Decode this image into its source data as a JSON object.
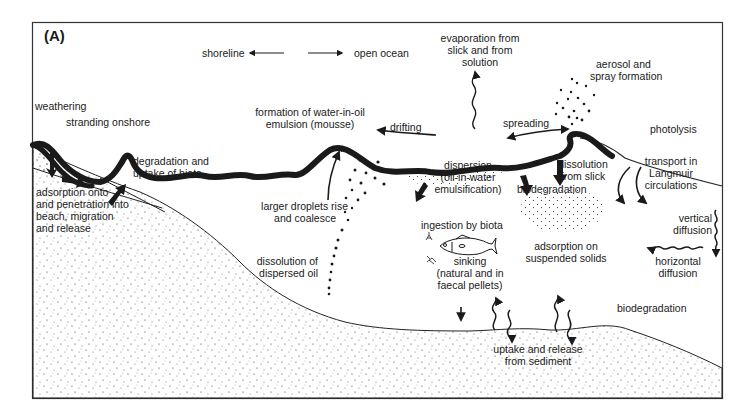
{
  "panel_label": "(A)",
  "direction": {
    "left": "shoreline",
    "right": "open ocean"
  },
  "labels": {
    "evaporation": [
      "evaporation from",
      "slick and from",
      "solution"
    ],
    "aerosol": [
      "aerosol and",
      "spray formation"
    ],
    "weathering": "weathering",
    "stranding": "stranding onshore",
    "mousse": [
      "formation of water-in-oil",
      "emulsion (mousse)"
    ],
    "drifting": "drifting",
    "spreading": "spreading",
    "photolysis": "photolysis",
    "degradation_uptake": [
      "degradation and",
      "uptake of biota"
    ],
    "adsorption_beach": [
      "adsorption onto",
      "and penetration into",
      "beach, migration",
      "and release"
    ],
    "dispersion": [
      "dispersion",
      "(oil-in-water",
      "emulsification)"
    ],
    "dissolution_slick": [
      "dissolution",
      "from slick"
    ],
    "langmuir": [
      "transport in",
      "Langmuir",
      "circulations"
    ],
    "biodegradation_upper": "biodegradation",
    "larger_droplets": [
      "larger droplets rise",
      "and coalesce"
    ],
    "ingestion": "ingestion by biota",
    "vertical_diffusion": [
      "vertical",
      "diffusion"
    ],
    "adsorption_solids": [
      "adsorption on",
      "suspended solids"
    ],
    "horizontal_diffusion": [
      "horizontal",
      "diffusion"
    ],
    "dissolution_dispersed": [
      "dissolution of",
      "dispersed oil"
    ],
    "sinking": [
      "sinking",
      "(natural and in",
      "faecal pellets)"
    ],
    "biodegradation_lower": "biodegradation",
    "sediment": [
      "uptake and release",
      "from sediment"
    ]
  },
  "icons": {
    "fish": "fish-icon",
    "plankton": "plankton-icon",
    "arrows": "arrow-icon",
    "wavy_arrows": "wavy-arrow-icon"
  },
  "colors": {
    "ink": "#1a1a1a",
    "background": "#ffffff"
  }
}
